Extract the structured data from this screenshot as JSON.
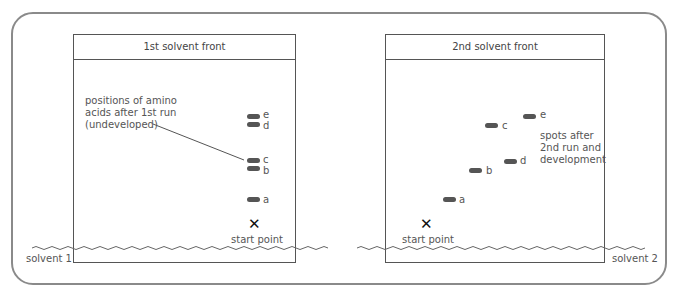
{
  "diagram": {
    "colors": {
      "frame": "#8a8a8a",
      "plate_border": "#555555",
      "spot": "#555555",
      "text": "#555555",
      "start_mark": "#111111"
    },
    "left_plate": {
      "header": "1st solvent front",
      "annotation": [
        "positions of amino",
        "acids after 1st run",
        "(undeveloped)"
      ],
      "start_label": "start point",
      "start_icon": "cross-icon",
      "solvent_label": "solvent 1",
      "spots": [
        {
          "label": "e"
        },
        {
          "label": "d"
        },
        {
          "label": "c"
        },
        {
          "label": "b"
        },
        {
          "label": "a"
        }
      ]
    },
    "right_plate": {
      "header": "2nd solvent front",
      "annotation": [
        "spots after",
        "2nd run and",
        "development"
      ],
      "start_label": "start point",
      "start_icon": "cross-icon",
      "solvent_label": "solvent 2",
      "spots": [
        {
          "label": "e"
        },
        {
          "label": "c"
        },
        {
          "label": "d"
        },
        {
          "label": "b"
        },
        {
          "label": "a"
        }
      ]
    },
    "start_symbol": "✕"
  }
}
